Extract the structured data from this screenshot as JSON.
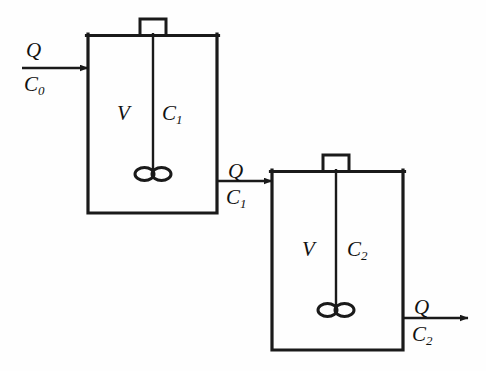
{
  "diagram": {
    "type": "process-flow-diagram",
    "line_color": "#1a1a1a",
    "text_color": "#111111",
    "background_color": "#fefefe"
  },
  "streams": {
    "feed": {
      "name": "feed-stream",
      "flow_label": "Q",
      "conc_label": "C",
      "conc_subscript": "0"
    },
    "intermediate": {
      "name": "tank1-to-tank2-stream",
      "flow_label": "Q",
      "conc_label": "C",
      "conc_subscript": "1"
    },
    "product": {
      "name": "product-stream",
      "flow_label": "Q",
      "conc_label": "C",
      "conc_subscript": "2"
    }
  },
  "tanks": [
    {
      "name": "tank-1",
      "volume_label": "V",
      "conc_label": "C",
      "conc_subscript": "1"
    },
    {
      "name": "tank-2",
      "volume_label": "V",
      "conc_label": "C",
      "conc_subscript": "2"
    }
  ]
}
